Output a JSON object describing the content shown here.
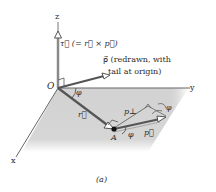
{
  "figure": {
    "caption": "(a)",
    "axes": {
      "x_label": "x",
      "y_label": "y",
      "z_label": "z",
      "origin_label": "O"
    },
    "labels": {
      "torque": "τ⃗ (= r⃗ × p⃗)",
      "p_redrawn_line1": "p⃗ (redrawn, with",
      "p_redrawn_line2": "tail at origin)",
      "phi_origin": "φ",
      "r_vector": "r⃗",
      "p_perp": "p⊥",
      "phi_tip": "φ",
      "point_A": "A",
      "phi_A": "φ",
      "p_vector": "p⃗"
    },
    "colors": {
      "axis": "#555555",
      "vector": "#505050",
      "plane": "#d4d4d4",
      "text": "#2a2a2a"
    }
  }
}
